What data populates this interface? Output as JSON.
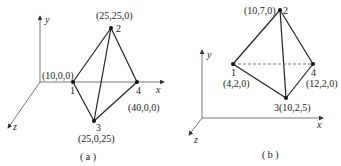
{
  "figures": [
    {
      "caption": "( a )",
      "axes": {
        "x": "x",
        "y": "y",
        "z": "z"
      },
      "nodes": [
        {
          "id": "1",
          "coord": "(10,0,0)"
        },
        {
          "id": "2",
          "coord": "(25,25,0)"
        },
        {
          "id": "3",
          "coord": "(25,0,25)"
        },
        {
          "id": "4",
          "coord": "(40,0,0)"
        }
      ],
      "edges": [
        [
          "1",
          "2"
        ],
        [
          "1",
          "3"
        ],
        [
          "2",
          "3"
        ],
        [
          "2",
          "4"
        ],
        [
          "3",
          "4"
        ]
      ]
    },
    {
      "caption": "( b )",
      "axes": {
        "x": "x",
        "y": "y",
        "z": "z"
      },
      "nodes": [
        {
          "id": "1",
          "coord": "(4,2,0)"
        },
        {
          "id": "2",
          "coord": "(10,7,0)"
        },
        {
          "id": "3",
          "coord": "(10,2,5)"
        },
        {
          "id": "4",
          "coord": "(12,2,0)"
        }
      ],
      "edges": [
        [
          "1",
          "2"
        ],
        [
          "1",
          "3"
        ],
        [
          "2",
          "3"
        ],
        [
          "2",
          "4"
        ],
        [
          "3",
          "4"
        ]
      ],
      "hidden_edges": [
        [
          "1",
          "4"
        ]
      ]
    }
  ],
  "colors": {
    "line": "#222222",
    "background": "#ffffff"
  }
}
